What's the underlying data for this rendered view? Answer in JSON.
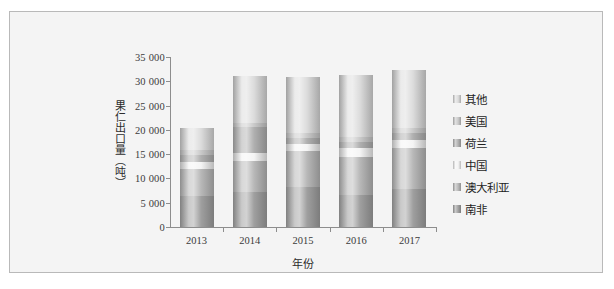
{
  "chart_data": {
    "type": "bar",
    "subtype": "stacked-cylinder",
    "title": "",
    "xlabel": "年份",
    "ylabel": "果仁出口量（吨）",
    "categories": [
      "2013",
      "2014",
      "2015",
      "2016",
      "2017"
    ],
    "ylim": [
      0,
      35000
    ],
    "yticks": [
      0,
      5000,
      10000,
      15000,
      20000,
      25000,
      30000,
      35000
    ],
    "ytick_labels": [
      "0",
      "5 000",
      "10 000",
      "15 000",
      "20 000",
      "25 000",
      "30 000",
      "35 000"
    ],
    "grid": false,
    "legend_position": "right",
    "stack_order_bottom_to_top": [
      "南非",
      "澳大利亚",
      "中国",
      "荷兰",
      "美国",
      "其他"
    ],
    "series": [
      {
        "name": "南非",
        "color": "#8a8a8a",
        "values": [
          6300,
          7300,
          8300,
          6600,
          7900
        ]
      },
      {
        "name": "澳大利亚",
        "color": "#a8a8a8",
        "values": [
          5700,
          6200,
          7300,
          7900,
          8400
        ]
      },
      {
        "name": "中国",
        "color": "#f2f2f2",
        "values": [
          1400,
          1700,
          1400,
          1700,
          1700
        ]
      },
      {
        "name": "荷兰",
        "color": "#9e9e9e",
        "values": [
          1400,
          5400,
          1400,
          1400,
          1400
        ]
      },
      {
        "name": "美国",
        "color": "#bdbdbd",
        "values": [
          1000,
          900,
          1000,
          1000,
          1000
        ]
      },
      {
        "name": "其他",
        "color": "#d4d4d4",
        "values": [
          4600,
          9500,
          11500,
          12800,
          11900
        ]
      }
    ],
    "totals": [
      20400,
      31000,
      30900,
      31400,
      32300
    ]
  },
  "legend": {
    "items": [
      {
        "label": "其他"
      },
      {
        "label": "美国"
      },
      {
        "label": "荷兰"
      },
      {
        "label": "中国"
      },
      {
        "label": "澳大利亚"
      },
      {
        "label": "南非"
      }
    ]
  }
}
